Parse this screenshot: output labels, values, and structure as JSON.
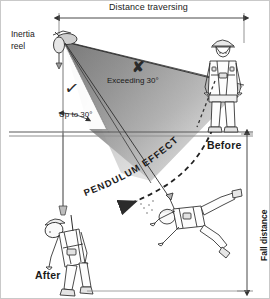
{
  "figure": {
    "title_alt": "Pendulum effect / swing fall hazard diagram",
    "background": "#ffffff",
    "ink": "#1a1a1a"
  },
  "dimensions": {
    "top": {
      "label": "Distance traversing",
      "orientation": "horizontal"
    },
    "right": {
      "label": "Fall distance",
      "orientation": "vertical"
    }
  },
  "anchor": {
    "label_line1": "Inertia",
    "label_line2": "reel",
    "icon": "inertia-reel-icon"
  },
  "zones": {
    "unsafe": {
      "mark": "✘",
      "label": "Exceeding 30°",
      "fill": "#9a9a9a"
    },
    "safe": {
      "mark": "✓",
      "label": "Up to 30°",
      "fill": "#ffffff"
    }
  },
  "pendulum": {
    "label": "PENDULUM EFFECT",
    "letters": [
      "P",
      "E",
      "N",
      "D",
      "U",
      "L",
      "U",
      "M",
      " ",
      "E",
      "F",
      "F",
      "E",
      "C",
      "T"
    ]
  },
  "states": {
    "before": "Before",
    "after": "After"
  },
  "figures": {
    "standing_worker": "standing-worker-figure",
    "swinging_worker": "swinging-worker-figure",
    "hanging_worker": "hanging-worker-figure"
  }
}
